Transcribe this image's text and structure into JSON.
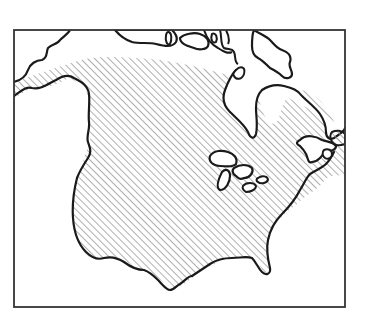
{
  "map": {
    "subject": "North America outline",
    "style": "black and white line drawing",
    "frame": {
      "x": 14,
      "y": 30,
      "width": 331,
      "height": 277
    },
    "colors": {
      "background": "#ffffff",
      "outline": "#1a1a1a",
      "frame": "#333333",
      "hatch": "#9a9a9a"
    },
    "shaded_region": {
      "pattern": "diagonal-hatch",
      "description": "Contiguous United States and southern Canada hatched"
    },
    "features": [
      "mainland-coastline",
      "hudson-bay",
      "great-lakes",
      "arctic-islands",
      "florida-peninsula",
      "newfoundland"
    ]
  }
}
